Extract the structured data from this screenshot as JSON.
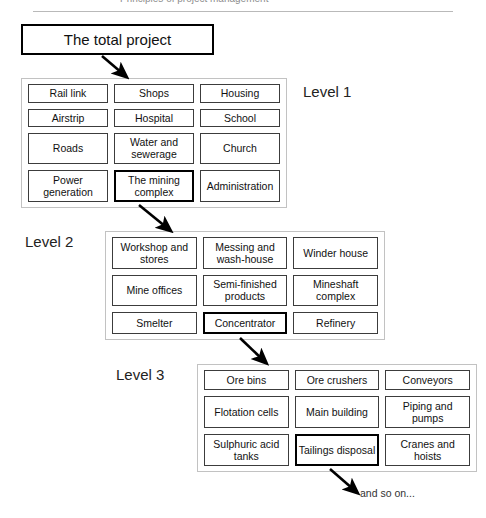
{
  "page": {
    "header_text_cropped": "Principles of project management",
    "root_box_label": "The total project",
    "tail_note": "and so on..."
  },
  "levels": [
    {
      "id": "level-1",
      "caption": "Level 1",
      "items": [
        {
          "label": "Rail link",
          "emphasis": false
        },
        {
          "label": "Shops",
          "emphasis": false
        },
        {
          "label": "Housing",
          "emphasis": false
        },
        {
          "label": "Airstrip",
          "emphasis": false
        },
        {
          "label": "Hospital",
          "emphasis": false
        },
        {
          "label": "School",
          "emphasis": false
        },
        {
          "label": "Roads",
          "emphasis": false
        },
        {
          "label": "Water and sewerage",
          "emphasis": false
        },
        {
          "label": "Church",
          "emphasis": false
        },
        {
          "label": "Power generation",
          "emphasis": false
        },
        {
          "label": "The mining complex",
          "emphasis": true
        },
        {
          "label": "Administration",
          "emphasis": false
        }
      ]
    },
    {
      "id": "level-2",
      "caption": "Level 2",
      "items": [
        {
          "label": "Workshop and stores",
          "emphasis": false
        },
        {
          "label": "Messing and wash-house",
          "emphasis": false
        },
        {
          "label": "Winder house",
          "emphasis": false
        },
        {
          "label": "Mine offices",
          "emphasis": false
        },
        {
          "label": "Semi-finished products",
          "emphasis": false
        },
        {
          "label": "Mineshaft complex",
          "emphasis": false
        },
        {
          "label": "Smelter",
          "emphasis": false
        },
        {
          "label": "Concentrator",
          "emphasis": true
        },
        {
          "label": "Refinery",
          "emphasis": false
        }
      ]
    },
    {
      "id": "level-3",
      "caption": "Level 3",
      "items": [
        {
          "label": "Ore bins",
          "emphasis": false
        },
        {
          "label": "Ore crushers",
          "emphasis": false
        },
        {
          "label": "Conveyors",
          "emphasis": false
        },
        {
          "label": "Flotation cells",
          "emphasis": false
        },
        {
          "label": "Main building",
          "emphasis": false
        },
        {
          "label": "Piping and pumps",
          "emphasis": false
        },
        {
          "label": "Sulphuric acid tanks",
          "emphasis": false
        },
        {
          "label": "Tailings disposal",
          "emphasis": true
        },
        {
          "label": "Cranes and hoists",
          "emphasis": false
        }
      ]
    }
  ],
  "connectors": [
    {
      "name": "root-to-level-1",
      "from": "The total project",
      "to": "Level 1 group"
    },
    {
      "name": "mining-to-level-2",
      "from": "The mining complex",
      "to": "Level 2 group"
    },
    {
      "name": "concentrator-to-level-3",
      "from": "Concentrator",
      "to": "Level 3 group"
    },
    {
      "name": "tailings-to-note",
      "from": "Tailings disposal",
      "to": "and so on..."
    }
  ],
  "colors": {
    "box_border": "#3c3c3c",
    "emphasis_border": "#000000",
    "group_border": "#c2c2c2",
    "background": "#ffffff",
    "text": "#111111"
  }
}
